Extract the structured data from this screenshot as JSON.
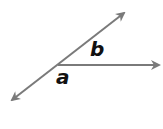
{
  "diagram": {
    "type": "angle-pair",
    "colors": {
      "line": "#7a7a7a",
      "label": "#111111",
      "background": "#ffffff"
    },
    "vertex": {
      "x": 58,
      "y": 65
    },
    "rays": [
      {
        "name": "ray-upper-right",
        "x1": 58,
        "y1": 65,
        "x2": 126,
        "y2": 11
      },
      {
        "name": "ray-lower-left",
        "x1": 58,
        "y1": 65,
        "x2": 10,
        "y2": 101
      },
      {
        "name": "ray-right",
        "x1": 58,
        "y1": 65,
        "x2": 161,
        "y2": 65
      }
    ],
    "labels": {
      "a": "a",
      "b": "b"
    }
  }
}
